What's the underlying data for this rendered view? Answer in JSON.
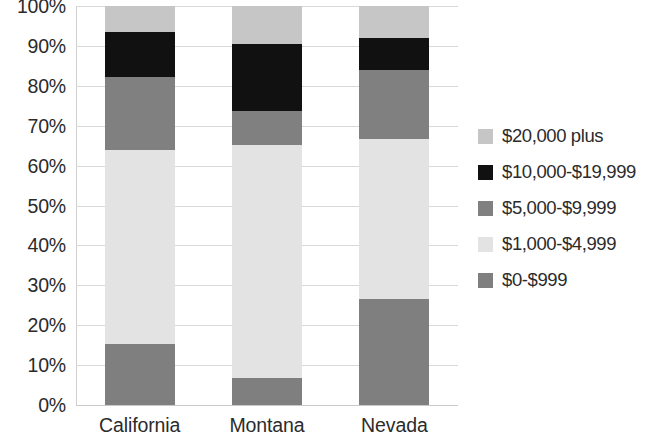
{
  "chart_data": {
    "type": "bar",
    "subtype": "stacked-percent",
    "title": "",
    "subtitle": "",
    "xlabel": "",
    "ylabel": "",
    "categories": [
      "California",
      "Montana",
      "Nevada"
    ],
    "ylim": [
      0,
      100
    ],
    "ytick_values": [
      0,
      10,
      20,
      30,
      40,
      50,
      60,
      70,
      80,
      90,
      100
    ],
    "ytick_labels": [
      "0%",
      "10%",
      "20%",
      "30%",
      "40%",
      "50%",
      "60%",
      "70%",
      "80%",
      "90%",
      "100%"
    ],
    "grid": true,
    "legend_position": "right",
    "stack_order_bottom_to_top": [
      "$0-$999",
      "$1,000-$4,999",
      "$5,000-$9,999",
      "$10,000-$19,999",
      "$20,000 plus"
    ],
    "series": [
      {
        "name": "$0-$999",
        "color": "#7f7f7f",
        "values": [
          15.3,
          6.8,
          26.5
        ]
      },
      {
        "name": "$1,000-$4,999",
        "color": "#e3e3e3",
        "values": [
          48.5,
          58.3,
          40.1
        ]
      },
      {
        "name": "$5,000-$9,999",
        "color": "#808080",
        "values": [
          18.3,
          8.5,
          17.4
        ]
      },
      {
        "name": "$10,000-$19,999",
        "color": "#111111",
        "values": [
          11.3,
          16.8,
          8.0
        ]
      },
      {
        "name": "$20,000 plus",
        "color": "#c6c6c6",
        "values": [
          6.6,
          9.6,
          8.0
        ]
      }
    ]
  },
  "legend": {
    "items": [
      {
        "label": "$20,000 plus",
        "color": "#c6c6c6"
      },
      {
        "label": "$10,000-$19,999",
        "color": "#111111"
      },
      {
        "label": "$5,000-$9,999",
        "color": "#808080"
      },
      {
        "label": "$1,000-$4,999",
        "color": "#e3e3e3"
      },
      {
        "label": "$0-$999",
        "color": "#7f7f7f"
      }
    ]
  },
  "axes": {
    "y_labels": [
      "100%",
      "90%",
      "80%",
      "70%",
      "60%",
      "50%",
      "40%",
      "30%",
      "20%",
      "10%",
      "0%"
    ],
    "x_labels": [
      "California",
      "Montana",
      "Nevada"
    ]
  },
  "colors": {
    "background": "#ffffff",
    "gridline": "#d9d9d9",
    "text": "#2b2b2b"
  }
}
